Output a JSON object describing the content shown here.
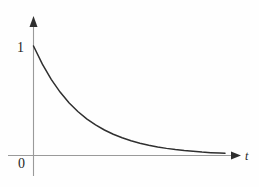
{
  "figure": {
    "background_color": "#fefefe",
    "width": 259,
    "height": 187
  },
  "axes": {
    "x_axis": {
      "name": "horizontal-axis",
      "label": "t",
      "color": "#9a9a9a",
      "arrow": "right-arrowhead"
    },
    "y_axis": {
      "name": "vertical-axis",
      "label": "",
      "color": "#9a9a9a",
      "arrow": "up-arrowhead"
    },
    "origin_label": "0",
    "y_tick_label": "1"
  },
  "chart_data": {
    "type": "line",
    "title": "",
    "xlabel": "t",
    "ylabel": "",
    "grid": false,
    "legend": null,
    "xlim": [
      0,
      5.4
    ],
    "ylim": [
      0,
      1.18
    ],
    "series": [
      {
        "name": "exponential decay",
        "color": "#2f2f2f",
        "function": "y = e^(-0.73 t)",
        "x": [
          0.0,
          0.25,
          0.5,
          0.75,
          1.0,
          1.25,
          1.5,
          1.75,
          2.0,
          2.25,
          2.5,
          2.75,
          3.0,
          3.25,
          3.5,
          3.75,
          4.0,
          4.25,
          4.5,
          4.75,
          5.0,
          5.25,
          5.4
        ],
        "y": [
          1.0,
          0.834,
          0.695,
          0.579,
          0.482,
          0.402,
          0.335,
          0.279,
          0.233,
          0.194,
          0.162,
          0.135,
          0.112,
          0.094,
          0.078,
          0.065,
          0.054,
          0.045,
          0.038,
          0.031,
          0.026,
          0.022,
          0.02
        ]
      }
    ],
    "annotations": [
      {
        "text": "1",
        "x": 0,
        "y": 1,
        "placement": "left-of-y-axis"
      },
      {
        "text": "0",
        "x": 0,
        "y": 0,
        "placement": "below-left-of-origin"
      },
      {
        "text": "t",
        "x": 5.6,
        "y": 0,
        "placement": "right-of-x-axis-arrow"
      }
    ]
  }
}
